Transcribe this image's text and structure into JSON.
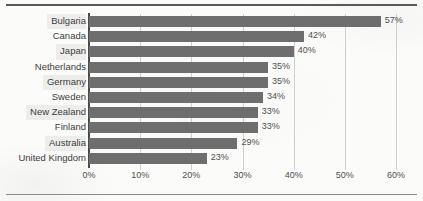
{
  "chart_data": {
    "type": "bar",
    "orientation": "horizontal",
    "title": "",
    "xlabel": "",
    "ylabel": "",
    "grid": true,
    "legend": null,
    "xlim": [
      0,
      60
    ],
    "xticks": [
      "0%",
      "10%",
      "20%",
      "30%",
      "40%",
      "50%",
      "60%"
    ],
    "xtick_values": [
      0,
      10,
      20,
      30,
      40,
      50,
      60
    ],
    "value_suffix": "%",
    "bar_color": "#6e6e6e",
    "categories": [
      "Bulgaria",
      "Canada",
      "Japan",
      "Netherlands",
      "Germany",
      "Sweden",
      "New Zealand",
      "Finland",
      "Australia",
      "United Kingdom"
    ],
    "values": [
      57,
      42,
      40,
      35,
      35,
      34,
      33,
      33,
      29,
      23
    ],
    "value_labels": [
      "57%",
      "42%",
      "40%",
      "35%",
      "35%",
      "34%",
      "33%",
      "33%",
      "29%",
      "23%"
    ]
  }
}
